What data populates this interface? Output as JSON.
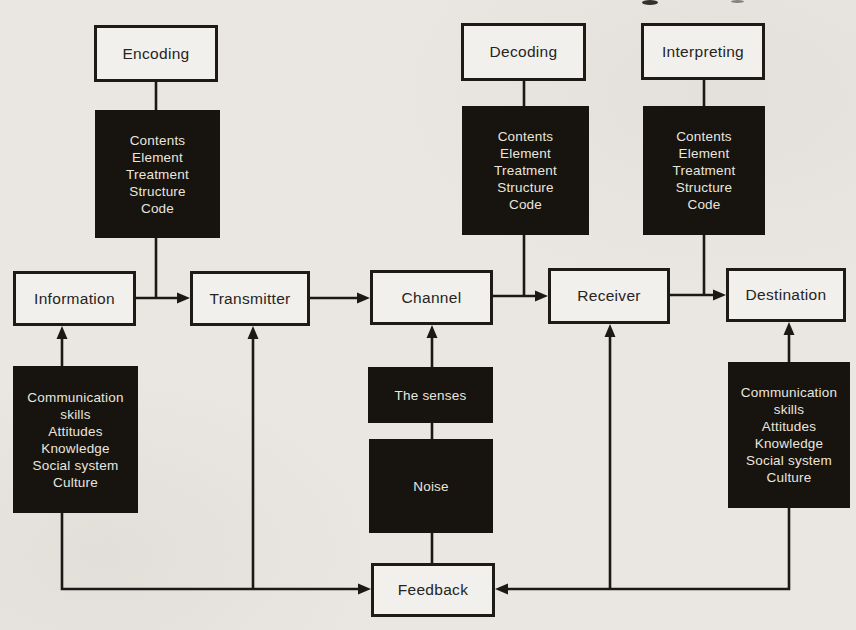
{
  "page": {
    "background_color": "#eae7e2",
    "box_fill_color": "#f2f0ec",
    "box_border_color": "#1d1a17",
    "black_box_color": "#17130f",
    "black_box_text_color": "#e9e6de",
    "line_color": "#1b1916"
  },
  "diagram": {
    "process_labels": {
      "encoding": "Encoding",
      "decoding": "Decoding",
      "interpreting": "Interpreting"
    },
    "message_factors": [
      "Contents",
      "Element",
      "Treatment",
      "Structure",
      "Code"
    ],
    "main_flow": {
      "information": "Information",
      "transmitter": "Transmitter",
      "channel": "Channel",
      "receiver": "Receiver",
      "destination": "Destination"
    },
    "source_factors": [
      "Communication skills",
      "Attitudes",
      "Knowledge",
      "Social system",
      "Culture"
    ],
    "receiver_factors": [
      "Communication skills",
      "Attitudes",
      "Knowledge",
      "Social system",
      "Culture"
    ],
    "channel_factors": {
      "senses": "The senses",
      "noise": "Noise"
    },
    "feedback": "Feedback"
  }
}
